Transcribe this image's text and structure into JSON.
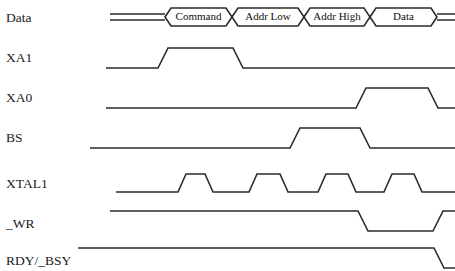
{
  "figure": {
    "type": "timing-diagram",
    "title": "",
    "background_color": "#ffffff",
    "line_color": "#2b2b2b",
    "text_color": "#1a1a1a",
    "width": 455,
    "height": 271
  },
  "signals": [
    {
      "name": "Data",
      "label": "Data",
      "kind": "bus",
      "row_y": 17,
      "label_x": 6,
      "label_y": 22,
      "segments": [
        {
          "label": "",
          "start": 110,
          "end": 165,
          "kind": "idle"
        },
        {
          "label": "Command",
          "start": 165,
          "end": 232,
          "kind": "valid"
        },
        {
          "label": "Addr Low",
          "start": 232,
          "end": 304,
          "kind": "valid"
        },
        {
          "label": "Addr High",
          "start": 304,
          "end": 370,
          "kind": "valid"
        },
        {
          "label": "Data",
          "start": 370,
          "end": 437,
          "kind": "valid"
        },
        {
          "label": "",
          "start": 437,
          "end": 455,
          "kind": "idle"
        }
      ]
    },
    {
      "name": "XA1",
      "label": "XA1",
      "kind": "logic",
      "low_y": 68,
      "high_y": 48,
      "label_x": 6,
      "label_y": 62,
      "start_x": 106,
      "end_x": 455,
      "edges": [
        {
          "x": 158,
          "to": "high",
          "slew": 10
        },
        {
          "x": 233,
          "to": "low",
          "slew": 10
        }
      ]
    },
    {
      "name": "XA0",
      "label": "XA0",
      "kind": "logic",
      "low_y": 108,
      "high_y": 88,
      "label_x": 6,
      "label_y": 102,
      "start_x": 106,
      "end_x": 455,
      "edges": [
        {
          "x": 356,
          "to": "high",
          "slew": 10
        },
        {
          "x": 428,
          "to": "low",
          "slew": 10
        }
      ]
    },
    {
      "name": "BS",
      "label": "BS",
      "kind": "logic",
      "low_y": 148,
      "high_y": 128,
      "label_x": 6,
      "label_y": 142,
      "start_x": 90,
      "end_x": 455,
      "edges": [
        {
          "x": 290,
          "to": "high",
          "slew": 10
        },
        {
          "x": 360,
          "to": "low",
          "slew": 10
        }
      ]
    },
    {
      "name": "XTAL1",
      "label": "XTAL1",
      "kind": "clock",
      "low_y": 192,
      "high_y": 174,
      "label_x": 6,
      "label_y": 188,
      "start_x": 116,
      "end_x": 455,
      "edges": [
        {
          "x": 178,
          "to": "high",
          "slew": 8
        },
        {
          "x": 205,
          "to": "low",
          "slew": 8
        },
        {
          "x": 249,
          "to": "high",
          "slew": 8
        },
        {
          "x": 280,
          "to": "low",
          "slew": 8
        },
        {
          "x": 318,
          "to": "high",
          "slew": 8
        },
        {
          "x": 348,
          "to": "low",
          "slew": 8
        },
        {
          "x": 384,
          "to": "high",
          "slew": 8
        },
        {
          "x": 414,
          "to": "low",
          "slew": 8
        }
      ]
    },
    {
      "name": "_WR",
      "label": "_WR",
      "kind": "logic",
      "low_y": 231,
      "high_y": 211,
      "label_x": 6,
      "label_y": 228,
      "start_x": 110,
      "end_x": 455,
      "initial": "high",
      "edges": [
        {
          "x": 358,
          "to": "low",
          "slew": 10
        },
        {
          "x": 433,
          "to": "high",
          "slew": 10
        }
      ]
    },
    {
      "name": "RDY/_BSY",
      "label": "RDY/_BSY",
      "kind": "logic",
      "low_y": 268,
      "high_y": 248,
      "label_x": 6,
      "label_y": 265,
      "start_x": 78,
      "end_x": 455,
      "initial": "high",
      "edges": [
        {
          "x": 434,
          "to": "low",
          "slew": 10
        }
      ]
    }
  ]
}
